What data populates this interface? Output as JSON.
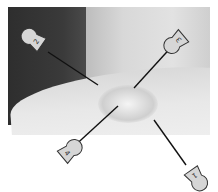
{
  "image": {
    "description": "Grayscale clinical photo of a skin lesion with four numbered pin markers pointing to the center",
    "markers": [
      {
        "label": "2",
        "position": "top-left"
      },
      {
        "label": "3",
        "position": "top-right"
      },
      {
        "label": "4",
        "position": "bottom-left"
      },
      {
        "label": "1",
        "position": "bottom-right"
      }
    ]
  }
}
